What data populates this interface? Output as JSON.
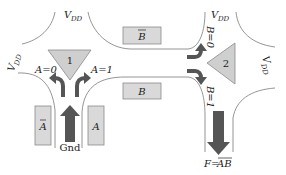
{
  "diagram": {
    "type": "transistor-logic-schematic",
    "colors": {
      "wire": "#777777",
      "gate_fill": "#d9d9d9",
      "gate_stroke": "#8a8a8a",
      "arrow": "#555555",
      "triangle_fill": "#cfcfcf",
      "text": "#222222"
    },
    "supplies": [
      {
        "id": "vdd-top-left",
        "label_main": "V",
        "label_sub": "DD"
      },
      {
        "id": "vdd-left",
        "label_main": "V",
        "label_sub": "DD"
      },
      {
        "id": "vdd-top-right",
        "label_main": "V",
        "label_sub": "DD"
      },
      {
        "id": "vdd-right",
        "label_main": "V",
        "label_sub": "DD"
      }
    ],
    "gates": [
      {
        "id": "gate-a-bar",
        "label": "A",
        "overbar": true
      },
      {
        "id": "gate-a",
        "label": "A",
        "overbar": false
      },
      {
        "id": "gate-b-bar",
        "label": "B",
        "overbar": true
      },
      {
        "id": "gate-b",
        "label": "B",
        "overbar": false
      }
    ],
    "junctions": [
      {
        "id": "junction-1",
        "label": "1"
      },
      {
        "id": "junction-2",
        "label": "2"
      }
    ],
    "branch_labels": {
      "a0": "A=0",
      "a1": "A=1",
      "b0": "B=0",
      "b1": "B=1"
    },
    "ground_label": "Gnd",
    "output_label": {
      "prefix": "F=",
      "expr": "AB",
      "overbar_on": "AB"
    }
  }
}
